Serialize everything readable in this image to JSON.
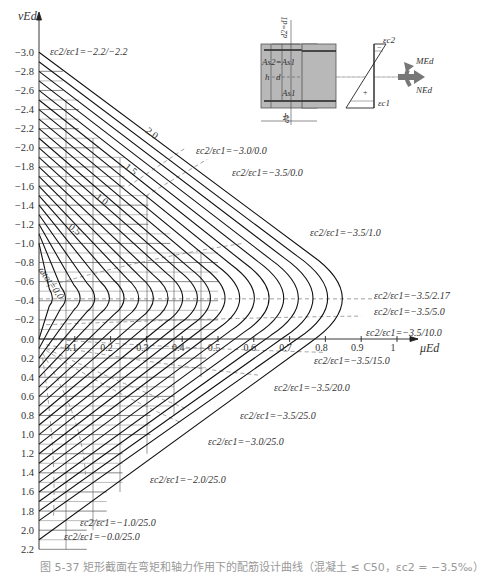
{
  "chart_data": {
    "type": "line",
    "xlabel": "μEd",
    "ylabel": "νEd",
    "xlim": [
      0,
      1.0
    ],
    "ylim": [
      -3.0,
      2.2
    ],
    "y_inverted": true,
    "grid": true,
    "x_ticks": [
      "0.1",
      "0.2",
      "0.3",
      "0.4",
      "0.5",
      "0.6",
      "0.7",
      "0.8",
      "0.9",
      "1"
    ],
    "y_ticks": [
      "-3.0",
      "-2.8",
      "-2.6",
      "-2.4",
      "-2.2",
      "-2.0",
      "-1.8",
      "-1.6",
      "-1.4",
      "-1.2",
      "-1.0",
      "-0.8",
      "-0.6",
      "-0.4",
      "-0.2",
      "0.0",
      "0.2",
      "0.4",
      "0.6",
      "0.8",
      "1.0",
      "1.2",
      "1.4",
      "1.6",
      "1.8",
      "2.0",
      "2.2"
    ],
    "omega_tot_curves": [
      {
        "omega": 0.0,
        "label": "ωtot=0.0"
      },
      {
        "omega": 0.1
      },
      {
        "omega": 0.2
      },
      {
        "omega": 0.3
      },
      {
        "omega": 0.4
      },
      {
        "omega": 0.5,
        "label": "0.5"
      },
      {
        "omega": 0.6
      },
      {
        "omega": 0.7
      },
      {
        "omega": 0.8
      },
      {
        "omega": 0.9
      },
      {
        "omega": 1.0,
        "label": "1.0"
      },
      {
        "omega": 1.1
      },
      {
        "omega": 1.2
      },
      {
        "omega": 1.3
      },
      {
        "omega": 1.4
      },
      {
        "omega": 1.5,
        "label": "1.5"
      },
      {
        "omega": 1.6
      },
      {
        "omega": 1.7
      },
      {
        "omega": 1.8
      },
      {
        "omega": 1.9
      },
      {
        "omega": 2.0,
        "label": "2.0"
      }
    ],
    "curve_shape": {
      "top_nu_at_mu0": [
        -1.0,
        -1.1,
        -1.2,
        -1.3,
        -1.4,
        -1.5,
        -1.6,
        -1.7,
        -1.8,
        -1.9,
        -2.0,
        -2.1,
        -2.2,
        -2.3,
        -2.4,
        -2.5,
        -2.6,
        -2.7,
        -2.8,
        -2.9,
        -3.0
      ],
      "bottom_nu_at_mu0": [
        0.0,
        0.1,
        0.2,
        0.3,
        0.4,
        0.5,
        0.6,
        0.7,
        0.8,
        0.9,
        1.0,
        1.1,
        1.2,
        1.3,
        1.4,
        1.5,
        1.6,
        1.7,
        1.8,
        1.9,
        2.1
      ],
      "nose_nu": -0.42,
      "nose_mu": [
        0.035,
        0.075,
        0.12,
        0.165,
        0.21,
        0.255,
        0.3,
        0.345,
        0.39,
        0.435,
        0.48,
        0.52,
        0.565,
        0.61,
        0.655,
        0.7,
        0.745,
        0.79,
        0.835,
        0.88,
        0.925
      ]
    },
    "strain_lines": [
      {
        "label": "εc2/εc1=−2.2/−2.2",
        "nu": -3.0,
        "mu": 0.0
      },
      {
        "label": "εc2/εc1=−3.0/0.0",
        "nu": -2.0,
        "mu": 0.41
      },
      {
        "label": "εc2/εc1=−3.5/0.0",
        "nu": -1.88,
        "mu": 0.47
      },
      {
        "label": "εc2/εc1=−3.5/1.0",
        "nu": -1.0,
        "mu": 0.57
      },
      {
        "label": "εc2/εc1=−3.5/2.17",
        "nu": -0.42,
        "mu": 0.92
      },
      {
        "label": "εc2/εc1=−3.5/5.0",
        "nu": -0.36,
        "mu": 0.92
      },
      {
        "label": "εc2/εc1=−3.5/10.0",
        "nu": -0.24,
        "mu": 0.9
      },
      {
        "label": "εc2/εc1=−3.5/15.0",
        "nu": 0.14,
        "mu": 0.8
      },
      {
        "label": "εc2/εc1=−3.5/20.0",
        "nu": 0.38,
        "mu": 0.62
      },
      {
        "label": "εc2/εc1=−3.5/25.0",
        "nu": 0.74,
        "mu": 0.42
      },
      {
        "label": "εc2/εc1=−3.0/25.0",
        "nu": 0.88,
        "mu": 0.4
      },
      {
        "label": "εc2/εc1=−2.0/25.0",
        "nu": 1.42,
        "mu": 0.13
      },
      {
        "label": "εc2/εc1=−1.0/25.0",
        "nu": 1.88,
        "mu": 0.04
      },
      {
        "label": "εc2/εc1=−0.0/25.0",
        "nu": 2.02,
        "mu": 0.02
      }
    ]
  },
  "axes": {
    "y_label": "νEd",
    "x_label": "μEd",
    "x_tick_labels": [
      "0.1",
      "0.2",
      "0.3",
      "0.4",
      "0.5",
      "0.6",
      "0.7",
      "0.8",
      "0.9",
      "1"
    ],
    "y_tick_labels": [
      "-3.0",
      "-2.8",
      "-2.6",
      "-2.4",
      "-2.2",
      "-2.0",
      "-1.8",
      "-1.6",
      "-1.4",
      "-1.2",
      "-1.0",
      "-0.8",
      "-0.6",
      "-0.4",
      "-0.2",
      "0.0",
      "0.2",
      "0.4",
      "0.6",
      "0.8",
      "1.0",
      "1.2",
      "1.4",
      "1.6",
      "1.8",
      "2.0",
      "2.2"
    ]
  },
  "curve_labels": {
    "omega0": "ωtot=0.0",
    "omega05": "0.5",
    "omega10": "1.0",
    "omega15": "1.5",
    "omega20": "2.0"
  },
  "strain_labels": {
    "s_top": "εc2/εc1=−2.2/−2.2",
    "s_30_00": "εc2/εc1=−3.0/0.0",
    "s_35_00": "εc2/εc1=−3.5/0.0",
    "s_35_10": "εc2/εc1=−3.5/1.0",
    "s_35_217": "εc2/εc1=−3.5/2.17",
    "s_35_50": "εc2/εc1=−3.5/5.0",
    "s_35_100": "εc2/εc1=−3.5/10.0",
    "s_35_150": "εc2/εc1=−3.5/15.0",
    "s_35_200": "εc2/εc1=−3.5/20.0",
    "s_35_250": "εc2/εc1=−3.5/25.0",
    "s_30_250": "εc2/εc1=−3.0/25.0",
    "s_20_250": "εc2/εc1=−2.0/25.0",
    "s_10_250": "εc2/εc1=−1.0/25.0",
    "s_00_250": "εc2/εc1=−0.0/25.0"
  },
  "section_diagram": {
    "as2_label": "As2=As1",
    "as1_label": "As1",
    "b_label": "b",
    "h_label": "h",
    "d_label": "d",
    "d1_label": "d1",
    "d2_label": "d2=d1",
    "ec2_label": "εc2",
    "ec1_label": "εc1",
    "minus_sign": "−",
    "plus_sign": "+",
    "m_label": "MEd",
    "n_label": "NEd"
  },
  "caption": "图 5-37  矩形截面在弯矩和轴力作用下的配筋设计曲线（混凝土 ≤ C50，εc2 = −3.5‰）"
}
